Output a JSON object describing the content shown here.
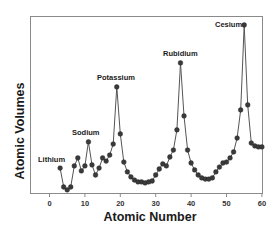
{
  "chart_data": {
    "type": "line",
    "title": "",
    "xlabel": "Atomic Number",
    "ylabel": "Atomic Volumes",
    "xlim": [
      -3,
      60
    ],
    "ylim": [
      0,
      70
    ],
    "x_ticks": [
      0,
      10,
      20,
      30,
      40,
      50,
      60
    ],
    "x_tick_labels": [
      "0",
      "10",
      "20",
      "30",
      "40",
      "50",
      "60"
    ],
    "y_ticks": [],
    "grid": false,
    "legend": null,
    "markers": true,
    "series": [
      {
        "name": "Atomic Volume",
        "x": [
          3,
          4,
          5,
          6,
          7,
          8,
          9,
          10,
          11,
          12,
          13,
          14,
          15,
          16,
          17,
          18,
          19,
          20,
          21,
          22,
          23,
          24,
          25,
          26,
          27,
          28,
          29,
          30,
          31,
          32,
          33,
          34,
          35,
          36,
          37,
          38,
          39,
          40,
          41,
          42,
          43,
          44,
          45,
          46,
          47,
          48,
          49,
          50,
          51,
          52,
          53,
          54,
          55,
          56,
          57,
          58,
          59,
          60
        ],
        "values": [
          10.4,
          2.5,
          1.3,
          2.5,
          11.3,
          14.6,
          9.2,
          11.3,
          21.3,
          11.7,
          7.5,
          10.4,
          14.6,
          13.3,
          15.8,
          20.4,
          44.2,
          24.6,
          12.9,
          8.8,
          6.7,
          5.4,
          4.6,
          4.6,
          4.2,
          4.6,
          5.0,
          7.5,
          10.0,
          12.1,
          11.3,
          15.0,
          17.9,
          26.3,
          54.2,
          32.1,
          17.9,
          12.5,
          9.6,
          7.5,
          6.3,
          5.8,
          5.8,
          6.3,
          8.8,
          10.8,
          12.5,
          12.9,
          14.6,
          17.1,
          22.9,
          34.6,
          70.0,
          36.7,
          20.8,
          19.6,
          19.2,
          19.2
        ],
        "color": "#444444"
      }
    ],
    "annotations": [
      {
        "text": "Lithium",
        "x": 3
      },
      {
        "text": "Sodium",
        "x": 11
      },
      {
        "text": "Potassium",
        "x": 19
      },
      {
        "text": "Rubidium",
        "x": 37
      },
      {
        "text": "Cesium",
        "x": 55
      }
    ]
  },
  "labels": {
    "xlabel": "Atomic Number",
    "ylabel": "Atomic Volumes",
    "ticks": [
      "0",
      "10",
      "20",
      "30",
      "40",
      "50",
      "60"
    ],
    "annotations": [
      "Lithium",
      "Sodium",
      "Potassium",
      "Rubidium",
      "Cesium"
    ]
  }
}
